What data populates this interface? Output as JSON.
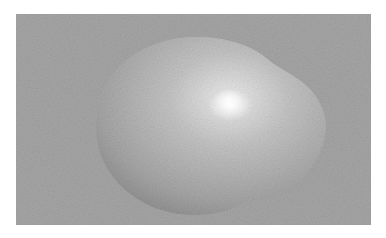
{
  "image": {
    "description": "Grayscale render of a smooth glossy blob shape on a noisy gray background",
    "colors": {
      "background_margin": "#ffffff",
      "backdrop": "#a4a4a4",
      "blob_base": "#b8b8b8",
      "blob_shadow": "#8c8c8c",
      "highlight": "#ffffff"
    }
  }
}
